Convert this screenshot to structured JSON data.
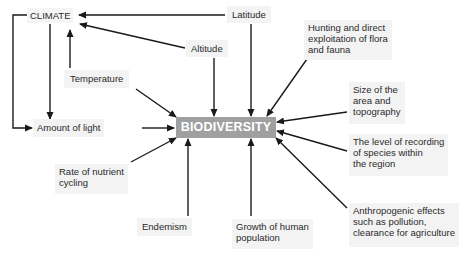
{
  "diagram": {
    "center": {
      "label": "BIODIVERSITY",
      "color": "#a0a0a0"
    },
    "nodes": {
      "climate": "CLIMATE",
      "latitude": "Latitude",
      "altitude": "Altitude",
      "temperature": "Temperature",
      "amount_of_light": "Amount of light",
      "nutrient_cycling": "Rate of nutrient\ncycling",
      "endemism": "Endemism",
      "human_population": "Growth of human\npopulation",
      "hunting": "Hunting and direct\nexploitation of flora\nand fauna",
      "area_size": "Size of the\narea and\ntopography",
      "recording_level": "The level of recording\nof species within\nthe region",
      "anthropogenic": "Anthropogenic effects\nsuch as pollution,\nclearance for agriculture"
    },
    "edges": [
      {
        "from": "Latitude",
        "to": "CLIMATE"
      },
      {
        "from": "Altitude",
        "to": "CLIMATE"
      },
      {
        "from": "Temperature",
        "to": "CLIMATE"
      },
      {
        "from": "CLIMATE",
        "to": "Amount of light"
      },
      {
        "from": "CLIMATE",
        "to": "Amount of light (side loop)"
      },
      {
        "from": "Latitude",
        "to": "BIODIVERSITY"
      },
      {
        "from": "Altitude",
        "to": "BIODIVERSITY"
      },
      {
        "from": "Temperature",
        "to": "BIODIVERSITY"
      },
      {
        "from": "Amount of light",
        "to": "BIODIVERSITY"
      },
      {
        "from": "Rate of nutrient cycling",
        "to": "BIODIVERSITY"
      },
      {
        "from": "Endemism",
        "to": "BIODIVERSITY"
      },
      {
        "from": "Growth of human population",
        "to": "BIODIVERSITY"
      },
      {
        "from": "Hunting and direct exploitation of flora and fauna",
        "to": "BIODIVERSITY"
      },
      {
        "from": "Size of the area and topography",
        "to": "BIODIVERSITY"
      },
      {
        "from": "The level of recording of species within the region",
        "to": "BIODIVERSITY"
      },
      {
        "from": "Anthropogenic effects such as pollution, clearance for agriculture",
        "to": "BIODIVERSITY"
      }
    ]
  }
}
